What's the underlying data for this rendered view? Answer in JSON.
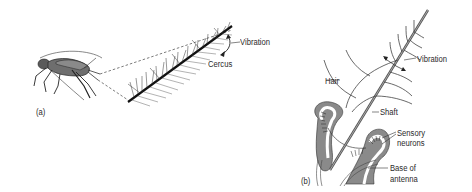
{
  "figure": {
    "panel_a": {
      "label": "(a)",
      "subject": "cricket",
      "annotations": {
        "vibration": "Vibration",
        "cercus": "Cercus"
      }
    },
    "panel_b": {
      "label": "(b)",
      "subject": "antenna hair cross-section",
      "annotations": {
        "vibration": "Vibration",
        "hair": "Hair",
        "shaft": "Shaft",
        "sensory_neurons_line1": "Sensory",
        "sensory_neurons_line2": "neurons",
        "base_line1": "Base of",
        "base_line2": "antenna"
      }
    },
    "colors": {
      "ink": "#2a2a2a",
      "body_gray": "#6e6e6e",
      "tissue_gray": "#8a8a8a",
      "light_gray": "#bdbdbd"
    }
  }
}
